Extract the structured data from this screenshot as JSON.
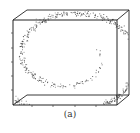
{
  "figure": {
    "caption": "(a)"
  },
  "chart_data": {
    "type": "scatter",
    "projection": "3d",
    "title": "",
    "caption": "(a)",
    "xlabel": "",
    "ylabel": "",
    "zlabel": "",
    "grid": false,
    "legend": null,
    "colors": {
      "points": "#333333",
      "box": "#222222"
    },
    "box": {
      "front": {
        "x0": 13,
        "y0": 20,
        "x1": 117,
        "y1": 105
      },
      "back": {
        "x0": 27,
        "y0": 10,
        "x1": 129,
        "y1": 95
      }
    },
    "ticks": {
      "left_y": [
        33,
        48,
        62,
        76,
        90
      ],
      "bottom_x": [
        32,
        53,
        75,
        96
      ]
    },
    "spiral": {
      "center": [
        70,
        56
      ],
      "t_start": 1.5,
      "t_end": 4.6,
      "scale": 5.9,
      "num_points": 900,
      "noise": 2.4,
      "seed": 7
    }
  }
}
